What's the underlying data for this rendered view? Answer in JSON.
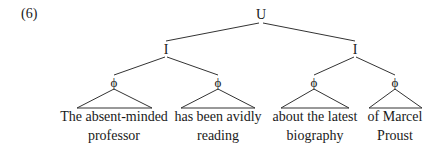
{
  "example_number": "(6)",
  "tree": {
    "root": {
      "label": "U",
      "x": 261,
      "y": 7
    },
    "intonational_phrases": [
      {
        "label": "I",
        "x": 166,
        "y": 42
      },
      {
        "label": "I",
        "x": 355,
        "y": 42
      }
    ],
    "phonological_phrases": [
      {
        "label": "ϕ",
        "x": 114,
        "y": 75,
        "parent": 0,
        "line1": "The absent-minded",
        "line2": "professor",
        "base_left": 77,
        "base_right": 152
      },
      {
        "label": "ϕ",
        "x": 218,
        "y": 75,
        "parent": 0,
        "line1": "has been avidly",
        "line2": "reading",
        "base_left": 181,
        "base_right": 255
      },
      {
        "label": "ϕ",
        "x": 314,
        "y": 75,
        "parent": 1,
        "line1": "about the latest",
        "line2": "biography",
        "base_left": 281,
        "base_right": 349
      },
      {
        "label": "ϕ",
        "x": 395,
        "y": 75,
        "parent": 1,
        "line1": "of Marcel",
        "line2": "Proust",
        "base_left": 369,
        "base_right": 422
      }
    ]
  },
  "colors": {
    "line": "#333333",
    "text": "#1a1a1a"
  }
}
